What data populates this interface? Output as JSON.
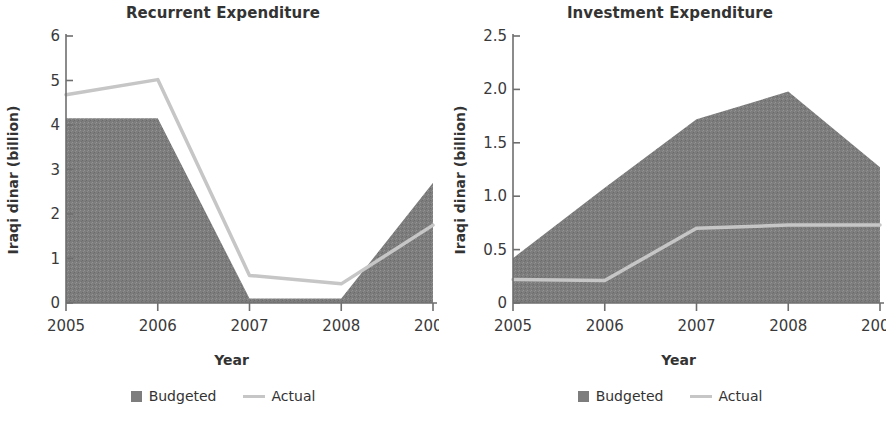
{
  "charts": [
    {
      "title": "Recurrent Expenditure",
      "ylabel": "Iraqi dinar (billion)",
      "xlabel": "Year",
      "legend": {
        "budgeted": "Budgeted",
        "actual": "Actual"
      }
    },
    {
      "title": "Investment Expenditure",
      "ylabel": "Iraqi dinar (billion)",
      "xlabel": "Year",
      "legend": {
        "budgeted": "Budgeted",
        "actual": "Actual"
      }
    }
  ],
  "colors": {
    "budgeted_fill": "#7d7d7d",
    "actual_line": "#c6c6c6",
    "axis": "#6e6e6e",
    "text": "#3a3a3a"
  },
  "chart_data": [
    {
      "type": "area",
      "title": "Recurrent Expenditure",
      "xlabel": "Year",
      "ylabel": "Iraqi dinar (billion)",
      "categories": [
        "2005",
        "2006",
        "2007",
        "2008",
        "2009"
      ],
      "x": [
        2005,
        2006,
        2007,
        2008,
        2009
      ],
      "xtick_labels": [
        "2005",
        "2006",
        "2007",
        "2008",
        "2009"
      ],
      "ytick_labels": [
        "0",
        "1",
        "2",
        "3",
        "4",
        "5",
        "6"
      ],
      "yticks": [
        0,
        1,
        2,
        3,
        4,
        5,
        6
      ],
      "ylim": [
        0,
        6
      ],
      "grid": false,
      "legend_position": "bottom",
      "series": [
        {
          "name": "Budgeted",
          "type": "area",
          "values": [
            4.15,
            4.15,
            0.1,
            0.1,
            2.7
          ]
        },
        {
          "name": "Actual",
          "type": "line",
          "values": [
            4.68,
            5.02,
            0.62,
            0.43,
            1.75
          ]
        }
      ]
    },
    {
      "type": "area",
      "title": "Investment Expenditure",
      "xlabel": "Year",
      "ylabel": "Iraqi dinar (billion)",
      "categories": [
        "2005",
        "2006",
        "2007",
        "2008",
        "2009"
      ],
      "x": [
        2005,
        2006,
        2007,
        2008,
        2009
      ],
      "xtick_labels": [
        "2005",
        "2006",
        "2007",
        "2008",
        "2009"
      ],
      "ytick_labels": [
        "0",
        "0.5",
        "1.0",
        "1.5",
        "2.0",
        "2.5"
      ],
      "yticks": [
        0,
        0.5,
        1.0,
        1.5,
        2.0,
        2.5
      ],
      "ylim": [
        0,
        2.5
      ],
      "grid": false,
      "legend_position": "bottom",
      "series": [
        {
          "name": "Budgeted",
          "type": "area",
          "values": [
            0.42,
            1.08,
            1.72,
            1.98,
            1.27
          ]
        },
        {
          "name": "Actual",
          "type": "line",
          "values": [
            0.22,
            0.21,
            0.7,
            0.73,
            0.73
          ]
        }
      ]
    }
  ]
}
